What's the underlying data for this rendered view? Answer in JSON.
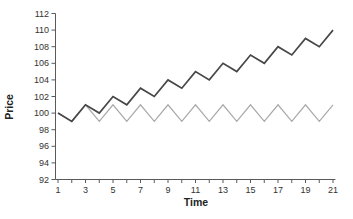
{
  "figure": {
    "background": "#ffffff"
  },
  "chart_data": {
    "type": "line",
    "title": "",
    "xlabel": "Time",
    "ylabel": "Price",
    "xlim": [
      1,
      21
    ],
    "ylim": [
      92,
      112
    ],
    "x": [
      1,
      2,
      3,
      4,
      5,
      6,
      7,
      8,
      9,
      10,
      11,
      12,
      13,
      14,
      15,
      16,
      17,
      18,
      19,
      20,
      21
    ],
    "x_tick_labels": [
      1,
      3,
      5,
      7,
      9,
      11,
      13,
      15,
      17,
      19,
      21
    ],
    "y_ticks": [
      92,
      94,
      96,
      98,
      100,
      102,
      104,
      106,
      108,
      110,
      112
    ],
    "grid": false,
    "legend": null,
    "colors": {
      "axis": "#5a5a5a",
      "tick_text": "#333333",
      "title_text": "#222222"
    },
    "series": [
      {
        "name": "oscillating-price",
        "color": "#a9a9a9",
        "width": 1.2,
        "values": [
          100,
          99,
          101,
          99,
          101,
          99,
          101,
          99,
          101,
          99,
          101,
          99,
          101,
          99,
          101,
          99,
          101,
          99,
          101,
          99,
          101
        ]
      },
      {
        "name": "trending-price",
        "color": "#474747",
        "width": 1.7,
        "values": [
          100,
          99,
          101,
          100,
          102,
          101,
          103,
          102,
          104,
          103,
          105,
          104,
          106,
          105,
          107,
          106,
          108,
          107,
          109,
          108,
          110
        ]
      }
    ]
  }
}
